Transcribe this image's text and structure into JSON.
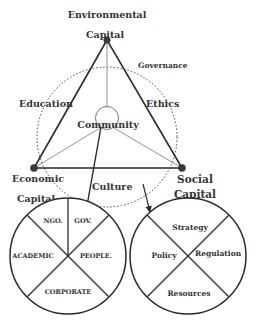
{
  "diagram": {
    "nodes": {
      "environmental": {
        "line1": "Environmental",
        "line2": "Capital"
      },
      "economic": {
        "line1": "Economic",
        "line2": "Capital"
      },
      "social": {
        "line1": "Social",
        "line2": "Capital"
      },
      "center": "Community"
    },
    "edge_labels": {
      "governance": "Governance",
      "education": "Education",
      "ethics": "Ethics",
      "culture": "Culture"
    },
    "left_circle": {
      "title": "Stakeholders",
      "sectors": {
        "top_left": "NGO.",
        "top_right": "GOV.",
        "left": "ACADEMIC",
        "right": "PEOPLE.",
        "bottom": "CORPORATE"
      }
    },
    "right_circle": {
      "sectors": {
        "top": "Strategy",
        "left": "Policy",
        "right": "Regulation",
        "bottom": "Resources"
      }
    },
    "colors": {
      "stroke": "#2a2a2a",
      "thin": "#777777",
      "node": "#3a3a3a",
      "text": "#333333"
    }
  }
}
